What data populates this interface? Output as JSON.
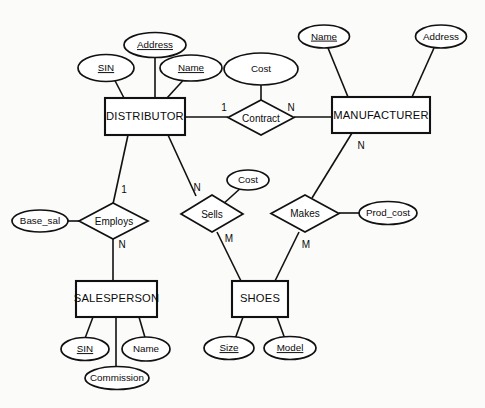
{
  "diagram": {
    "type": "er-diagram",
    "notation": "Chen",
    "entities": [
      {
        "id": "distributor",
        "label": "DISTRIBUTOR"
      },
      {
        "id": "manufacturer",
        "label": "MANUFACTURER"
      },
      {
        "id": "salesperson",
        "label": "SALESPERSON"
      },
      {
        "id": "shoes",
        "label": "SHOES"
      }
    ],
    "relationships": [
      {
        "id": "contract",
        "label": "Contract"
      },
      {
        "id": "employs",
        "label": "Employs"
      },
      {
        "id": "sells",
        "label": "Sells"
      },
      {
        "id": "makes",
        "label": "Makes"
      }
    ],
    "attributes": [
      {
        "id": "dist-sin",
        "label": "SIN",
        "key": true,
        "owner": "distributor"
      },
      {
        "id": "dist-address",
        "label": "Address",
        "key": true,
        "owner": "distributor"
      },
      {
        "id": "dist-name",
        "label": "Name",
        "key": true,
        "owner": "distributor"
      },
      {
        "id": "contract-cost",
        "label": "Cost",
        "key": false,
        "owner": "contract"
      },
      {
        "id": "manu-name",
        "label": "Name",
        "key": true,
        "owner": "manufacturer"
      },
      {
        "id": "manu-address",
        "label": "Address",
        "key": false,
        "owner": "manufacturer"
      },
      {
        "id": "employs-base",
        "label": "Base_sal",
        "key": false,
        "owner": "employs"
      },
      {
        "id": "sells-cost",
        "label": "Cost",
        "key": false,
        "owner": "sells"
      },
      {
        "id": "makes-prod",
        "label": "Prod_cost",
        "key": false,
        "owner": "makes"
      },
      {
        "id": "sp-sin",
        "label": "SIN",
        "key": true,
        "owner": "salesperson"
      },
      {
        "id": "sp-name",
        "label": "Name",
        "key": false,
        "owner": "salesperson"
      },
      {
        "id": "sp-commission",
        "label": "Commission",
        "key": false,
        "owner": "salesperson"
      },
      {
        "id": "shoes-size",
        "label": "Size",
        "key": true,
        "owner": "shoes"
      },
      {
        "id": "shoes-model",
        "label": "Model",
        "key": true,
        "owner": "shoes"
      }
    ],
    "cardinalities": [
      {
        "id": "card-contract-dist",
        "label": "1",
        "edge": "distributor-contract"
      },
      {
        "id": "card-contract-manu",
        "label": "N",
        "edge": "contract-manufacturer"
      },
      {
        "id": "card-employs-dist",
        "label": "1",
        "edge": "distributor-employs"
      },
      {
        "id": "card-employs-sp",
        "label": "N",
        "edge": "employs-salesperson"
      },
      {
        "id": "card-sells-dist",
        "label": "N",
        "edge": "distributor-sells"
      },
      {
        "id": "card-sells-shoes",
        "label": "M",
        "edge": "sells-shoes"
      },
      {
        "id": "card-makes-manu",
        "label": "N",
        "edge": "manufacturer-makes"
      },
      {
        "id": "card-makes-shoes",
        "label": "M",
        "edge": "makes-shoes"
      }
    ],
    "colors": {
      "stroke": "#111111",
      "fill": "#ffffff",
      "background": "#fbfbfa",
      "text": "#0b0b0b"
    }
  }
}
